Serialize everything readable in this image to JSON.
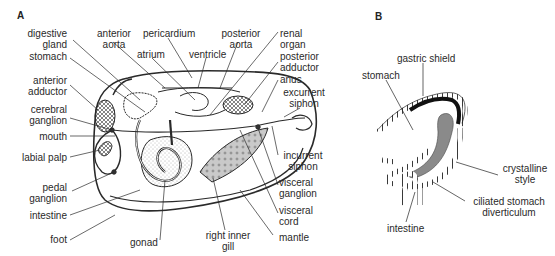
{
  "panels": {
    "a": {
      "letter": "A",
      "labels": {
        "digestive_gland": "digestive\ngland",
        "anterior_aorta": "anterior\naorta",
        "pericardium": "pericardium",
        "posterior_aorta": "posterior\naorta",
        "renal_organ": "renal\norgan",
        "atrium": "atrium",
        "ventricle": "ventricle",
        "stomach": "stomach",
        "posterior_adductor": "posterior\nadductor",
        "anus": "anus",
        "anterior_adductor": "anterior\nadductor",
        "excurrent_siphon": "excurrent\nsiphon",
        "cerebral_ganglion": "cerebral\nganglion",
        "mouth": "mouth",
        "labial_palp": "labial palp",
        "incurrent_siphon": "incurrent\nsiphon",
        "pedal_ganglion": "pedal\nganglion",
        "visceral_ganglion": "visceral\nganglion",
        "intestine": "intestine",
        "visceral_cord": "visceral\ncord",
        "foot": "foot",
        "gonad": "gonad",
        "right_inner_gill": "right inner\ngill",
        "mantle": "mantle"
      }
    },
    "b": {
      "letter": "B",
      "labels": {
        "gastric_shield": "gastric shield",
        "stomach": "stomach",
        "crystalline_style": "crystalline\nstyle",
        "ciliated_stomach_diverticulum": "ciliated stomach\ndiverticulum",
        "intestine": "intestine"
      }
    }
  },
  "colors": {
    "line": "#2a2a2a",
    "style_fill": "#8a8a8a",
    "shield_fill": "#111111",
    "background": "#ffffff"
  }
}
